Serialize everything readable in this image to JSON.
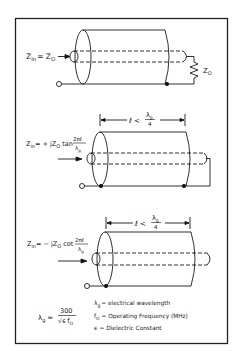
{
  "figure": {
    "border_color": "#222222",
    "line_color": "#1a1a1a",
    "panels": [
      {
        "id": "matched",
        "formula": {
          "lhs": "Z",
          "lhs_sub": "in",
          "rhs": "= Z",
          "rhs_sub": "O"
        },
        "load_label": {
          "main": "Z",
          "sub": "O"
        },
        "termination": "resistor"
      },
      {
        "id": "shorted",
        "formula": {
          "lhs": "Z",
          "lhs_sub": "in",
          "rhs": "= + jZ",
          "rhs_sub": "O",
          "func": "tan",
          "frac_num": "2πℓ",
          "frac_den_main": "λ",
          "frac_den_sub": "g"
        },
        "dimension": {
          "text": "ℓ <",
          "frac_num_main": "λ",
          "frac_num_sub": "g",
          "frac_den": "4"
        },
        "termination": "short"
      },
      {
        "id": "open",
        "formula": {
          "lhs": "Z",
          "lhs_sub": "in",
          "rhs": "= − jZ",
          "rhs_sub": "O",
          "func": "cot",
          "frac_num": "2πℓ",
          "frac_den_main": "λ",
          "frac_den_sub": "g"
        },
        "dimension": {
          "text": "ℓ <",
          "frac_num_main": "λ",
          "frac_num_sub": "g",
          "frac_den": "4"
        },
        "termination": "open"
      }
    ],
    "legend": {
      "equation": {
        "lhs_main": "λ",
        "lhs_sub": "g",
        "eq": "=",
        "num": "300",
        "den_sqrt": "√ϵ",
        "den_f": "f",
        "den_f_sub": "O"
      },
      "definitions": [
        {
          "sym_main": "λ",
          "sym_sub": "g",
          "text": "= electrical wavelength"
        },
        {
          "sym_main": "f",
          "sym_sub": "O",
          "text": "= Operating Frequency (MHz)"
        },
        {
          "sym_main": "ϵ",
          "sym_sub": "",
          "text": "= Dielectric Constant"
        }
      ]
    }
  }
}
